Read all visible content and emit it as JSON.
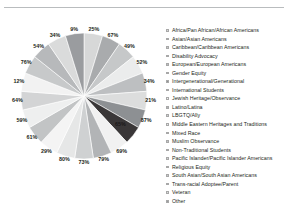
{
  "chart_data": {
    "type": "pie",
    "title": "",
    "subtitle": "",
    "xlabel": "",
    "ylabel": "",
    "grid": false,
    "legend_position": "right",
    "note": "Each wedge is drawn at an equal angular width; the printed percentage label on each wedge is the response rate for that category, not the wedge's share of the circle.",
    "categories": [
      "Africa/Pan African/African Americans",
      "Asian/Asian Americans",
      "Caribbean/Caribbean Americans",
      "Disability Advocacy",
      "European/European Americans",
      "Gender Equity",
      "Intergenerational/Generational",
      "International Students",
      "Jewish Heritage/Observance",
      "Latino/Latina",
      "LBGTQ/Ally",
      "Middle Eastern Heritages and Traditions",
      "Mixed Race",
      "Muslim Observance",
      "Non-Traditional Students",
      "Pacific Islander/Pacific Islander Americans",
      "Religious Equity",
      "South Asian/South Asian Americans",
      "Trans-racial Adoptee/Parent",
      "Veteran",
      "Other"
    ],
    "values": [
      25,
      67,
      49,
      52,
      34,
      21,
      87,
      65,
      69,
      79,
      73,
      80,
      29,
      61,
      59,
      64,
      12,
      76,
      54,
      34,
      9
    ],
    "value_labels": [
      "25%",
      "67%",
      "49%",
      "52%",
      "34%",
      "21%",
      "87%",
      "65%",
      "69%",
      "79%",
      "73%",
      "80%",
      "29%",
      "61%",
      "59%",
      "64%",
      "12%",
      "76%",
      "54%",
      "34%",
      "9%"
    ],
    "slice_colors": [
      "#d7d8d8",
      "#a9abad",
      "#c6c8c9",
      "#ebecec",
      "#bdbfc1",
      "#dcdddd",
      "#8d9093",
      "#3a3738",
      "#f1f1f1",
      "#b2b4b6",
      "#cfd1d2",
      "#e6e7e7",
      "#f4f4f4",
      "#c2c4c5",
      "#eeefef",
      "#d3d4d5",
      "#f2f2f2",
      "#c7c9ca",
      "#b7b9bb",
      "#dadbdb",
      "#9a9c9f"
    ],
    "ylim": [
      0,
      100
    ]
  },
  "legend": {
    "items": [
      {
        "label": "Africa/Pan African/African Americans"
      },
      {
        "label": "Asian/Asian Americans"
      },
      {
        "label": "Caribbean/Caribbean Americans"
      },
      {
        "label": "Disability Advocacy"
      },
      {
        "label": "European/European Americans"
      },
      {
        "label": "Gender Equity"
      },
      {
        "label": "Intergenerational/Generational"
      },
      {
        "label": "International Students"
      },
      {
        "label": "Jewish Heritage/Observance"
      },
      {
        "label": "Latino/Latina"
      },
      {
        "label": "LBGTQ/Ally"
      },
      {
        "label": "Middle Eastern Heritages and Traditions"
      },
      {
        "label": "Mixed Race"
      },
      {
        "label": "Muslim Observance"
      },
      {
        "label": "Non-Traditional Students"
      },
      {
        "label": "Pacific Islander/Pacific Islander Americans"
      },
      {
        "label": "Religious Equity"
      },
      {
        "label": "South Asian/South Asian Americans"
      },
      {
        "label": "Trans-racial Adoptee/Parent"
      },
      {
        "label": "Veteran"
      },
      {
        "label": "Other"
      }
    ]
  },
  "colors": {
    "rule": "#b9bcbe",
    "text": "#231f20",
    "background": "#ffffff"
  }
}
